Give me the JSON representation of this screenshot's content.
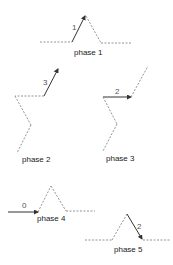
{
  "diagram": {
    "colors": {
      "solid": "#333333",
      "dotted": "#888888",
      "label": "#222222"
    },
    "phases": [
      {
        "label": "phase 1",
        "step": "1"
      },
      {
        "label": "phase 2",
        "step": "3"
      },
      {
        "label": "phase 3",
        "step": "2"
      },
      {
        "label": "phase 4",
        "step": "0"
      },
      {
        "label": "phase 5",
        "step": "2"
      }
    ]
  }
}
